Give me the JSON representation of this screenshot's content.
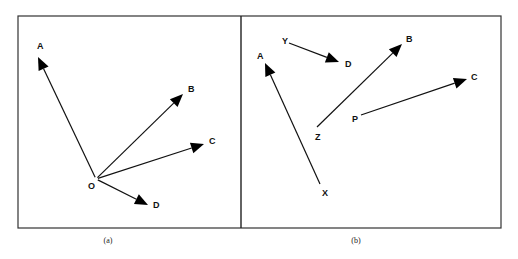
{
  "panels": [
    {
      "caption": "(a)",
      "points": [
        {
          "id": "O",
          "label": "O"
        },
        {
          "id": "A",
          "label": "A"
        },
        {
          "id": "B",
          "label": "B"
        },
        {
          "id": "C",
          "label": "C"
        },
        {
          "id": "D",
          "label": "D"
        }
      ],
      "vectors": [
        {
          "from": "O",
          "to": "A"
        },
        {
          "from": "O",
          "to": "B"
        },
        {
          "from": "O",
          "to": "C"
        },
        {
          "from": "O",
          "to": "D"
        }
      ]
    },
    {
      "caption": "(b)",
      "points": [
        {
          "id": "X",
          "label": "X"
        },
        {
          "id": "A",
          "label": "A"
        },
        {
          "id": "Y",
          "label": "Y"
        },
        {
          "id": "D",
          "label": "D"
        },
        {
          "id": "Z",
          "label": "Z"
        },
        {
          "id": "B",
          "label": "B"
        },
        {
          "id": "P",
          "label": "P"
        },
        {
          "id": "C",
          "label": "C"
        }
      ],
      "vectors": [
        {
          "from": "X",
          "to": "A"
        },
        {
          "from": "Y",
          "to": "D"
        },
        {
          "from": "Z",
          "to": "B"
        },
        {
          "from": "P",
          "to": "C"
        }
      ]
    }
  ]
}
